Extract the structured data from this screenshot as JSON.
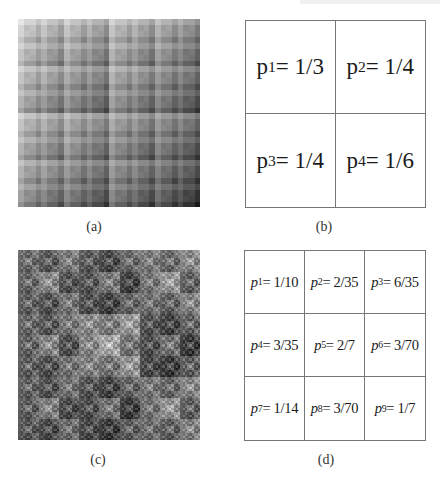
{
  "figure": {
    "panels": [
      {
        "id": "a",
        "caption": "(a)",
        "kind": "multifractal-image",
        "grid": 2,
        "probabilities": [
          0.3333333,
          0.25,
          0.25,
          0.1666667
        ],
        "levels": 5,
        "bounds": {
          "x": 18,
          "y": 19,
          "w": 182,
          "h": 188
        }
      },
      {
        "id": "b",
        "caption": "(b)",
        "kind": "probability-grid",
        "grid": 2,
        "cells": [
          {
            "var": "p",
            "sub": "1",
            "eq": " = 1/3"
          },
          {
            "var": "p",
            "sub": "2",
            "eq": " = 1/4"
          },
          {
            "var": "p",
            "sub": "3",
            "eq": " = 1/4"
          },
          {
            "var": "p",
            "sub": "4",
            "eq": " = 1/6"
          }
        ],
        "bounds": {
          "x": 245,
          "y": 20,
          "w": 181,
          "h": 188
        }
      },
      {
        "id": "c",
        "caption": "(c)",
        "kind": "multifractal-image",
        "grid": 3,
        "probabilities": [
          0.1,
          0.0571429,
          0.1714286,
          0.0857143,
          0.2857143,
          0.0428571,
          0.0714286,
          0.0428571,
          0.1428571
        ],
        "levels": 4,
        "bounds": {
          "x": 18,
          "y": 250,
          "w": 182,
          "h": 190
        }
      },
      {
        "id": "d",
        "caption": "(d)",
        "kind": "probability-grid",
        "grid": 3,
        "cells": [
          {
            "var": "p",
            "sub": "1",
            "eq": " = 1/10"
          },
          {
            "var": "p",
            "sub": "2",
            "eq": " = 2/35"
          },
          {
            "var": "p",
            "sub": "3",
            "eq": " = 6/35"
          },
          {
            "var": "p",
            "sub": "4",
            "eq": " = 3/35"
          },
          {
            "var": "p",
            "sub": "5",
            "eq": " = 2/7"
          },
          {
            "var": "p",
            "sub": "6",
            "eq": " = 3/70"
          },
          {
            "var": "p",
            "sub": "7",
            "eq": " = 1/14"
          },
          {
            "var": "p",
            "sub": "8",
            "eq": " = 3/70"
          },
          {
            "var": "p",
            "sub": "9",
            "eq": " = 1/7"
          }
        ],
        "bounds": {
          "x": 244,
          "y": 250,
          "w": 182,
          "h": 191
        }
      }
    ],
    "colors": {
      "border": "#777777",
      "text": "#1a1a1a",
      "caption": "#333333"
    }
  }
}
